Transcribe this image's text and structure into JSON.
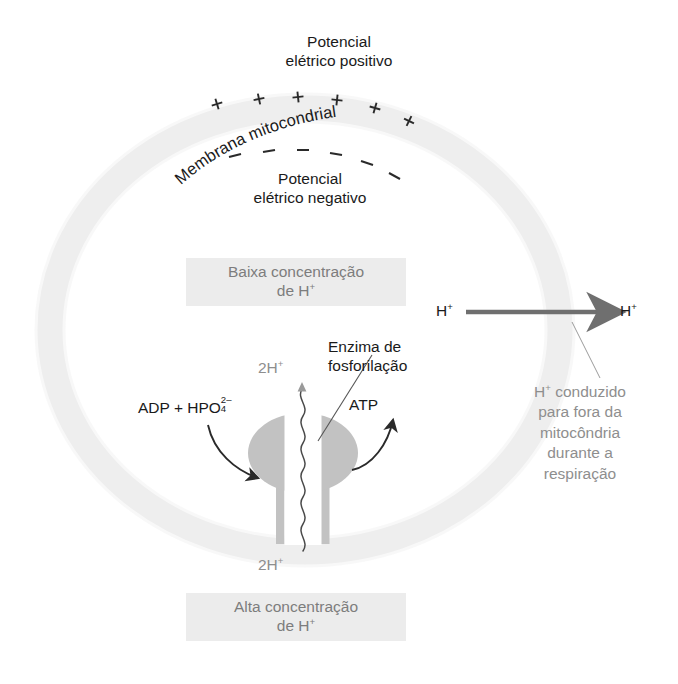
{
  "figure": {
    "title_top_line1": "Potencial",
    "title_top_line2": "elétrico positivo",
    "membrane_label": "Membrana mitocondrial",
    "title_inner_line1": "Potencial",
    "title_inner_line2": "elétrico negativo",
    "plus_charges": [
      "+",
      "+",
      "+",
      "+",
      "+",
      "+"
    ],
    "minus_charges": [
      "–",
      "–",
      "–",
      "–",
      "–",
      "–"
    ]
  },
  "boxes": {
    "low_conc": {
      "line1": "Baixa concentração",
      "line2_prefix": "de H",
      "line2_sup": "+"
    },
    "high_conc": {
      "line1": "Alta concentração",
      "line2_prefix": "de H",
      "line2_sup": "+"
    }
  },
  "labels": {
    "enzyme_line1": "Enzima de",
    "enzyme_line2": "fosforilação",
    "substrate_prefix": "ADP + HPO",
    "substrate_sub": "4",
    "substrate_sup": "2–",
    "product": "ATP",
    "proton_top_prefix": "2H",
    "proton_top_sup": "+",
    "proton_bottom_prefix": "2H",
    "proton_bottom_sup": "+",
    "h_left_prefix": "H",
    "h_left_sup": "+",
    "h_right_prefix": "H",
    "h_right_sup": "+",
    "efflux_line1_prefix": "H",
    "efflux_line1_sup": "+",
    "efflux_line1_rest": " conduzido",
    "efflux_line2": "para fora da",
    "efflux_line3": "mitocôndria",
    "efflux_line4": "durante a",
    "efflux_line5": "respiração"
  },
  "colors": {
    "membrane": "#e9e9e9",
    "enzyme": "#c2c2c2",
    "box_fill": "#ececec",
    "box_text": "#7d7d7d",
    "ink": "#1a1a1a",
    "gray_text": "#8e8e8e",
    "arrow_gray": "#6f6f6f"
  }
}
